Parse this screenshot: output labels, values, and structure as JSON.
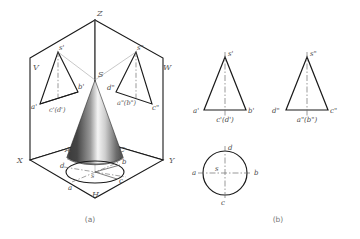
{
  "figure": {
    "captions": {
      "left": "(a)",
      "right": "(b)"
    }
  },
  "colors": {
    "outline": "#1a1a1a",
    "thin_line": "#8a8a8a",
    "center_line": "#7a7a7a",
    "label": "#4a4a4a",
    "cone_dark": "#3a3a3a",
    "cone_light": "#f2f2f2",
    "background": "#ffffff"
  },
  "part_a": {
    "name": "pictorial-projection-box",
    "axes": {
      "z": "Z",
      "x": "X",
      "y": "Y"
    },
    "planes": {
      "v": "V",
      "w": "W",
      "h": "H"
    },
    "cone_apex": "S",
    "v_projection": {
      "apex": "s'",
      "left": "a'",
      "right": "b'",
      "center": "c'(d')"
    },
    "w_projection": {
      "apex": "s\"",
      "left": "d\"",
      "right": "c\"",
      "center": "a\"(b\")"
    },
    "h_projection": {
      "center": "s",
      "left": "d",
      "right": "b",
      "top_left": "a",
      "bottom_right": "c",
      "base_left": "A",
      "base_right": "C"
    }
  },
  "part_b": {
    "name": "orthographic-views",
    "front_view": {
      "apex": "s'",
      "left": "a'",
      "right": "b'",
      "center": "c'(d')"
    },
    "side_view": {
      "apex": "s\"",
      "left": "d\"",
      "right": "c\"",
      "center": "a\"(b\")"
    },
    "top_view": {
      "top": "d",
      "left": "a",
      "right": "b",
      "bottom": "c",
      "center": "s"
    }
  }
}
